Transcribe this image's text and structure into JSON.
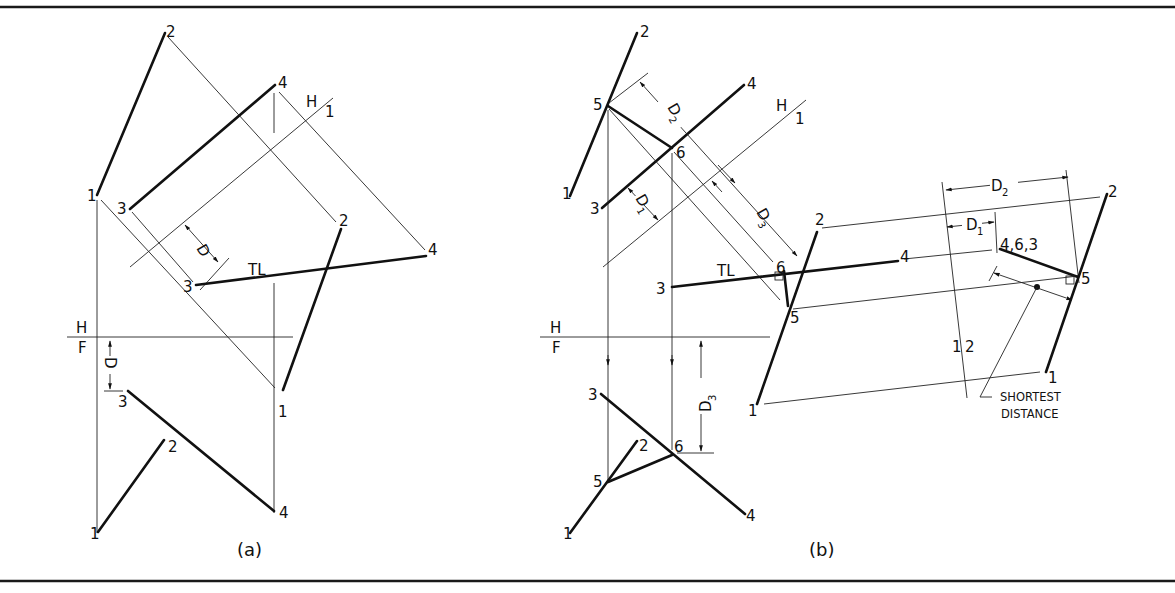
{
  "figure": {
    "panels": [
      {
        "id": "a",
        "caption": "(a)",
        "fold_line_top": {
          "upper": "H",
          "lower": "1"
        },
        "fold_line_front": {
          "upper": "H",
          "lower": "F"
        },
        "dimension_label": "D",
        "true_length_label": "TL",
        "point_labels": {
          "top_view": [
            "1",
            "2",
            "3",
            "4"
          ],
          "aux_view": [
            "2",
            "3",
            "4"
          ],
          "front_view": [
            "1",
            "2",
            "3",
            "4"
          ]
        }
      },
      {
        "id": "b",
        "caption": "(b)",
        "fold_line_top": {
          "upper": "H",
          "lower": "1"
        },
        "fold_line_front": {
          "upper": "H",
          "lower": "F"
        },
        "fold_line_aux": {
          "left": "1",
          "right": "2"
        },
        "dimension_labels": {
          "d1": "D",
          "d1_sub": "1",
          "d2": "D",
          "d2_sub": "2",
          "d3": "D",
          "d3_sub": "3"
        },
        "true_length_label": "TL",
        "point_view_label": "4,6,3",
        "annotation_line1": "SHORTEST",
        "annotation_line2": "DISTANCE",
        "point_labels": {
          "top_view": [
            "1",
            "2",
            "3",
            "4",
            "5",
            "6"
          ],
          "aux_view": [
            "2",
            "3",
            "4",
            "5",
            "6",
            "1"
          ],
          "secondary_aux_view": [
            "2",
            "5",
            "1"
          ],
          "front_view": [
            "1",
            "2",
            "3",
            "4",
            "5",
            "6"
          ]
        }
      }
    ]
  }
}
